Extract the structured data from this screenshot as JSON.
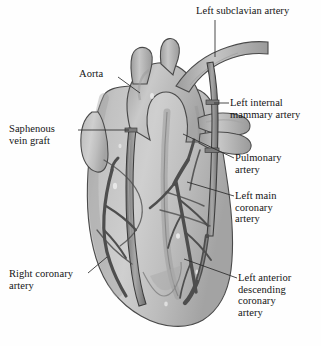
{
  "figure": {
    "background_color": "#fefefe",
    "ink_color": "#141414",
    "heart_fill": "#b9b9b9",
    "heart_shadow": "#9a9a9a",
    "heart_highlight": "#d5d5d5",
    "vessel_fill": "#8f8f8f",
    "vessel_stroke": "#3d3d3d",
    "graft_fill": "#7e7e7e",
    "leader_color": "#2a2a2a"
  },
  "labels": [
    {
      "id": "left-subclavian-artery",
      "text": "Left subclavian artery",
      "side": "right",
      "x": 196,
      "y": 5,
      "leader": [
        [
          215,
          20
        ],
        [
          215,
          56
        ]
      ]
    },
    {
      "id": "aorta",
      "text": "Aorta",
      "side": "left",
      "x": 79,
      "y": 68,
      "leader": [
        [
          118,
          77
        ],
        [
          139,
          93
        ]
      ]
    },
    {
      "id": "left-internal-mammary-artery",
      "text": "Left internal\nmammary artery",
      "side": "right",
      "x": 230,
      "y": 97,
      "leader": [
        [
          228,
          103
        ],
        [
          214,
          103
        ]
      ]
    },
    {
      "id": "saphenous-vein-graft",
      "text": "Saphenous\nvein graft",
      "side": "left",
      "x": 9,
      "y": 123,
      "leader": [
        [
          78,
          130
        ],
        [
          129,
          130
        ]
      ]
    },
    {
      "id": "pulmonary-artery",
      "text": "Pulmonary\nartery",
      "side": "right",
      "x": 235,
      "y": 152,
      "leader": [
        [
          233,
          158
        ],
        [
          181,
          133
        ]
      ]
    },
    {
      "id": "left-main-coronary-artery",
      "text": "Left main\ncoronary\nartery",
      "side": "right",
      "x": 235,
      "y": 190,
      "leader": [
        [
          233,
          196
        ],
        [
          186,
          182
        ]
      ]
    },
    {
      "id": "right-coronary-artery",
      "text": "Right coronary\nartery",
      "side": "left",
      "x": 9,
      "y": 268,
      "leader": [
        [
          87,
          273
        ],
        [
          104,
          258
        ]
      ]
    },
    {
      "id": "left-anterior-descending-coronary-artery",
      "text": "Left anterior\ndescending\ncoronary\nartery",
      "side": "right",
      "x": 238,
      "y": 272,
      "leader": [
        [
          236,
          278
        ],
        [
          183,
          259
        ]
      ]
    }
  ],
  "anatomy_parts": [
    "aortic arch",
    "brachiocephalic trunk",
    "left common carotid artery",
    "left subclavian artery",
    "left internal mammary artery graft",
    "saphenous vein graft",
    "pulmonary artery",
    "left main coronary artery",
    "left anterior descending coronary artery",
    "right coronary artery",
    "left ventricle",
    "right ventricle",
    "cardiac apex"
  ]
}
